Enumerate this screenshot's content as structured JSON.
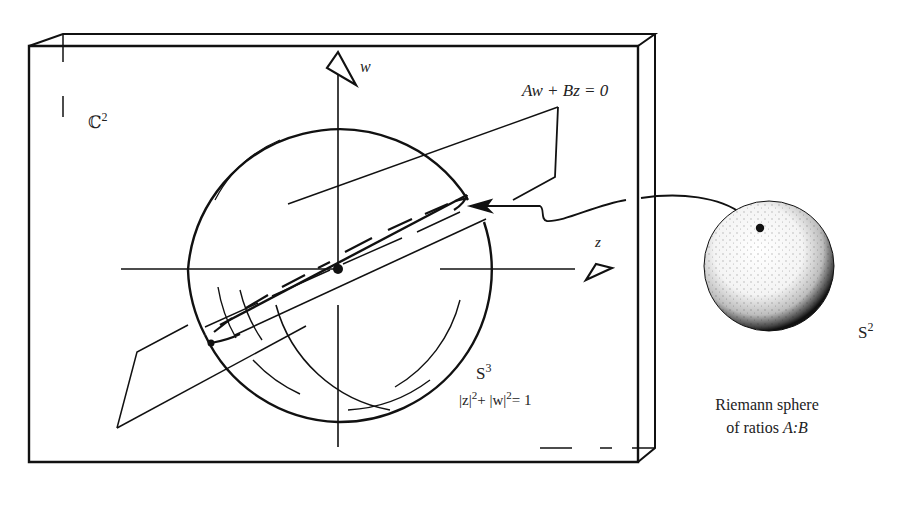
{
  "diagram": {
    "space_label": "ℂ",
    "space_sup": "2",
    "axis_w_label": "w",
    "axis_z_label": "z",
    "plane_equation": "Aw + Bz = 0",
    "sphere3_label": "S",
    "sphere3_sup": "3",
    "sphere3_eq_part1": "|z|",
    "sphere3_eq_sup1": "2",
    "sphere3_eq_part2": "+ |w|",
    "sphere3_eq_sup2": "2",
    "sphere3_eq_part3": "= 1",
    "sphere2_label": "S",
    "sphere2_sup": "2",
    "riemann_caption_line1": "Riemann sphere",
    "riemann_caption_line2_prefix": "of ratios ",
    "riemann_caption_line2_ratio": "A:B"
  },
  "colors": {
    "ink": "#111111",
    "paper": "#ffffff"
  }
}
